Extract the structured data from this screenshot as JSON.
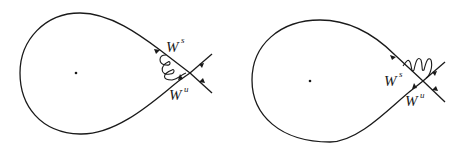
{
  "figures": [
    {
      "id": "left",
      "stable_label": {
        "base": "W",
        "sup": "s"
      },
      "unstable_label": {
        "base": "W",
        "sup": "u"
      },
      "description": "Homoclinic loop with stable manifold oscillating inside the loop"
    },
    {
      "id": "right",
      "stable_label": {
        "base": "W",
        "sup": "s"
      },
      "unstable_label": {
        "base": "W",
        "sup": "u"
      },
      "description": "Homoclinic loop with stable manifold oscillating outside the loop"
    }
  ],
  "colors": {
    "stroke": "#1a1a1a",
    "background": "#ffffff"
  }
}
